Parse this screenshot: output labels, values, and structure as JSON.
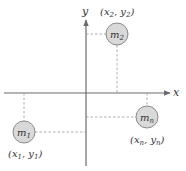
{
  "diagram": {
    "axes": {
      "x_label": "x",
      "y_label": "y",
      "color": "#6b6b6b"
    },
    "masses": [
      {
        "name": "m1",
        "label": "m",
        "subscript": "1",
        "coord_label": "(x₁, y₁)",
        "quadrant": "III"
      },
      {
        "name": "m2",
        "label": "m",
        "subscript": "2",
        "coord_label": "(x₂, y₂)",
        "quadrant": "I"
      },
      {
        "name": "mn",
        "label": "m",
        "subscript": "n",
        "coord_label": "(xₙ, yₙ)",
        "quadrant": "IV"
      }
    ],
    "mass_fill": "#d9d9d9",
    "mass_stroke": "#8a8a8a"
  }
}
